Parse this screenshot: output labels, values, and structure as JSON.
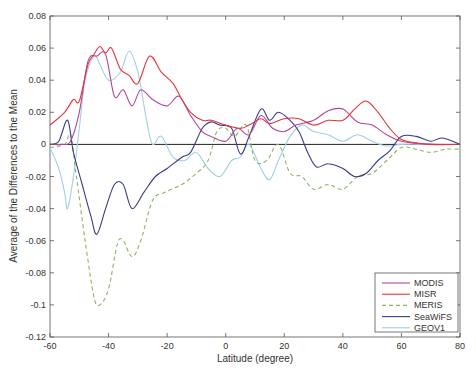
{
  "chart_data": {
    "type": "line",
    "title": "",
    "xlabel": "Latitude (degree)",
    "ylabel": "Average of the Differences to the Mean",
    "xlim": [
      -60,
      80
    ],
    "ylim": [
      -0.12,
      0.08
    ],
    "xticks": [
      -60,
      -40,
      -20,
      0,
      20,
      40,
      60,
      80
    ],
    "xtick_labels": [
      "-60",
      "-40",
      "-20",
      "0",
      "20",
      "40",
      "60",
      "80"
    ],
    "yticks": [
      -0.12,
      -0.1,
      -0.08,
      -0.06,
      -0.04,
      -0.02,
      0,
      0.02,
      0.04,
      0.06,
      0.08
    ],
    "ytick_labels": [
      "-0.12",
      "-0.1",
      "-0.08",
      "-0.06",
      "-0.04",
      "-0.02",
      "0",
      "0.02",
      "0.04",
      "0.06",
      "0.08"
    ],
    "grid": false,
    "zero_line": true,
    "legend_position": "lower right",
    "series": [
      {
        "name": "MODIS",
        "color": "#b0479a",
        "dash": false,
        "x": [
          -60,
          -56,
          -53,
          -50,
          -47,
          -44,
          -41,
          -38,
          -35,
          -32,
          -29,
          -25,
          -20,
          -16,
          -12,
          -8,
          -5,
          0,
          4,
          8,
          12,
          16,
          20,
          24,
          30,
          35,
          40,
          45,
          50,
          55,
          60,
          70,
          80
        ],
        "y": [
          0,
          0,
          0.002,
          0.02,
          0.052,
          0.055,
          0.056,
          0.03,
          0.034,
          0.024,
          0.034,
          0.028,
          0.024,
          0.03,
          0.018,
          0.008,
          0.005,
          0.002,
          0.01,
          0.006,
          0.018,
          0.01,
          0.008,
          0.012,
          0.015,
          0.021,
          0.022,
          0.014,
          0.012,
          0.006,
          0.002,
          0,
          0
        ]
      },
      {
        "name": "MISR",
        "color": "#e8323c",
        "dash": false,
        "x": [
          -60,
          -55,
          -52,
          -50,
          -47,
          -45,
          -43,
          -41,
          -39,
          -36,
          -33,
          -30,
          -26,
          -22,
          -18,
          -15,
          -12,
          -8,
          -5,
          0,
          5,
          8,
          12,
          15,
          20,
          25,
          30,
          35,
          40,
          44,
          48,
          52,
          56,
          60,
          65,
          70,
          80
        ],
        "y": [
          0.012,
          0.02,
          0.028,
          0.027,
          0.05,
          0.056,
          0.061,
          0.057,
          0.06,
          0.047,
          0.043,
          0.038,
          0.055,
          0.045,
          0.038,
          0.028,
          0.02,
          0.015,
          0.015,
          0.012,
          0.01,
          0.012,
          0.016,
          0.013,
          0.016,
          0.016,
          0.012,
          0.015,
          0.015,
          0.022,
          0.027,
          0.02,
          0.01,
          0.003,
          0.001,
          0,
          0
        ]
      },
      {
        "name": "MERIS",
        "color": "#8cb560",
        "dash": true,
        "x": [
          -60,
          -55,
          -53,
          -51,
          -48,
          -45,
          -43,
          -40,
          -37,
          -35,
          -32,
          -29,
          -25,
          -21,
          -15,
          -10,
          -6,
          -3,
          0,
          3,
          7,
          10,
          14,
          18,
          22,
          26,
          30,
          35,
          40,
          45,
          50,
          55,
          60,
          65,
          70,
          75,
          80
        ],
        "y": [
          -0.002,
          0,
          0.006,
          -0.02,
          -0.06,
          -0.095,
          -0.1,
          -0.09,
          -0.062,
          -0.06,
          -0.07,
          -0.06,
          -0.035,
          -0.03,
          -0.025,
          -0.018,
          -0.01,
          0.008,
          0.01,
          0.005,
          0.012,
          -0.01,
          -0.01,
          0,
          -0.018,
          -0.02,
          -0.028,
          -0.025,
          -0.028,
          -0.02,
          -0.018,
          -0.01,
          -0.002,
          -0.003,
          -0.005,
          -0.003,
          -0.003
        ]
      },
      {
        "name": "SeaWiFS",
        "color": "#3a3a8a",
        "dash": false,
        "x": [
          -60,
          -57,
          -54,
          -52,
          -49,
          -46,
          -44,
          -41,
          -38,
          -35,
          -32,
          -28,
          -24,
          -20,
          -15,
          -12,
          -8,
          -5,
          -2,
          2,
          5,
          8,
          12,
          15,
          18,
          22,
          25,
          28,
          31,
          35,
          40,
          44,
          48,
          52,
          56,
          60,
          65,
          70,
          74,
          80
        ],
        "y": [
          0,
          0.002,
          0.015,
          -0.005,
          -0.025,
          -0.045,
          -0.056,
          -0.04,
          -0.025,
          -0.025,
          -0.04,
          -0.03,
          -0.02,
          -0.015,
          -0.008,
          -0.005,
          0.01,
          0.014,
          0.012,
          0.01,
          -0.006,
          0.005,
          0.022,
          0.015,
          0.02,
          0.015,
          0.008,
          -0.005,
          -0.014,
          -0.012,
          -0.015,
          -0.02,
          -0.018,
          -0.01,
          -0.004,
          0.005,
          0.005,
          0.002,
          0.004,
          0
        ]
      },
      {
        "name": "GEOV1",
        "color": "#9fd0e0",
        "dash": false,
        "x": [
          -60,
          -57,
          -55,
          -54,
          -52,
          -50,
          -48,
          -45,
          -43,
          -40,
          -36,
          -33,
          -30,
          -27,
          -25,
          -22,
          -18,
          -14,
          -10,
          -6,
          -2,
          2,
          5,
          8,
          12,
          15,
          18,
          22,
          26,
          30,
          35,
          40,
          45,
          50,
          55,
          60,
          70,
          80
        ],
        "y": [
          -0.002,
          -0.015,
          -0.03,
          -0.04,
          -0.02,
          0.01,
          0.04,
          0.055,
          0.05,
          0.04,
          0.045,
          0.058,
          0.045,
          0.015,
          0,
          0.005,
          -0.008,
          -0.01,
          -0.005,
          -0.015,
          -0.02,
          -0.01,
          -0.008,
          0,
          -0.015,
          -0.022,
          -0.01,
          0.005,
          0.012,
          0.008,
          0.006,
          0.002,
          0.006,
          0.002,
          -0.001,
          0,
          0,
          0
        ]
      }
    ]
  }
}
